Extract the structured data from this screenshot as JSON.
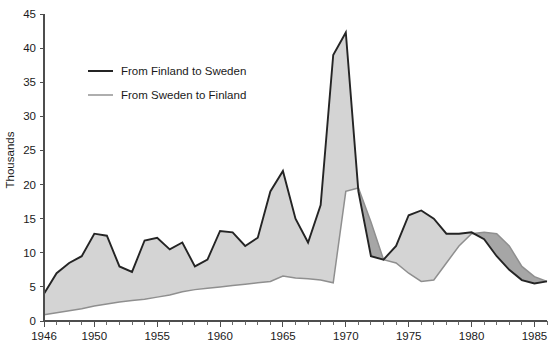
{
  "chart_data": {
    "type": "area",
    "title": "",
    "subtitle": "",
    "xlabel": "",
    "ylabel": "Thousands",
    "xlim": [
      1946,
      1986
    ],
    "ylim": [
      0,
      45
    ],
    "ytick_step": 5,
    "yticks": [
      0,
      5,
      10,
      15,
      20,
      25,
      30,
      35,
      40,
      45
    ],
    "ytick_labels": [
      "0",
      "5",
      "10",
      "15",
      "20",
      "25",
      "30",
      "35",
      "40",
      "45"
    ],
    "xticks_labeled": [
      1946,
      1950,
      1955,
      1960,
      1965,
      1970,
      1975,
      1980,
      1985
    ],
    "xtick_labels": [
      "1946",
      "1950",
      "1955",
      "1960",
      "1965",
      "1970",
      "1975",
      "1980",
      "1985"
    ],
    "xtick_minor_step": 1,
    "grid": false,
    "legend_position": "upper-left-inside",
    "x": [
      1946,
      1947,
      1948,
      1949,
      1950,
      1951,
      1952,
      1953,
      1954,
      1955,
      1956,
      1957,
      1958,
      1959,
      1960,
      1961,
      1962,
      1963,
      1964,
      1965,
      1966,
      1967,
      1968,
      1969,
      1970,
      1971,
      1972,
      1973,
      1974,
      1975,
      1976,
      1977,
      1978,
      1979,
      1980,
      1981,
      1982,
      1983,
      1984,
      1985,
      1986
    ],
    "series": [
      {
        "name": "From Finland to Sweden",
        "color": "#242424",
        "values": [
          4.0,
          7.0,
          8.5,
          9.5,
          12.8,
          12.5,
          8.0,
          7.2,
          11.8,
          12.2,
          10.5,
          11.5,
          8.0,
          9.0,
          13.2,
          13.0,
          11.0,
          12.2,
          19.0,
          22.0,
          15.0,
          11.5,
          17.0,
          39.0,
          42.3,
          19.0,
          9.5,
          9.0,
          11.0,
          15.5,
          16.2,
          15.0,
          12.8,
          12.8,
          13.0,
          12.0,
          9.5,
          7.5,
          6.0,
          5.5,
          5.8
        ]
      },
      {
        "name": "From Sweden to Finland",
        "color": "#8f8f8f",
        "values": [
          0.9,
          1.2,
          1.5,
          1.8,
          2.2,
          2.5,
          2.8,
          3.0,
          3.2,
          3.5,
          3.8,
          4.3,
          4.6,
          4.8,
          5.0,
          5.2,
          5.4,
          5.6,
          5.8,
          6.6,
          6.3,
          6.2,
          6.0,
          5.6,
          19.0,
          19.5,
          14.5,
          9.0,
          8.5,
          7.0,
          5.8,
          6.0,
          8.5,
          11.0,
          12.8,
          13.0,
          12.8,
          11.0,
          8.0,
          6.5,
          5.8
        ]
      }
    ],
    "band_notes": [
      {
        "label": "light-band-finland-above-sweden",
        "color": "#d4d4d4"
      },
      {
        "label": "dark-band-sweden-above-finland",
        "color": "#a6a6a6"
      }
    ]
  },
  "legend": {
    "items": [
      {
        "label": "From Finland to Sweden",
        "swatch": "dark-line-swatch"
      },
      {
        "label": "From Sweden to Finland",
        "swatch": "light-line-swatch"
      }
    ]
  },
  "axes": {
    "y_axis_title": "Thousands"
  },
  "caption": {
    "text": ""
  }
}
